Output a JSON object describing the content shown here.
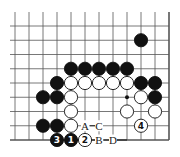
{
  "diagram": {
    "type": "go-board-fragment",
    "columns": 12,
    "rows": 9,
    "edges": {
      "right": true,
      "bottom": true,
      "left": false,
      "top": false
    },
    "colors": {
      "black": "#111111",
      "white": "#ffffff",
      "line": "#555555"
    },
    "star_points": [
      {
        "col": 8,
        "row": 5
      }
    ],
    "stones": [
      {
        "col": 9,
        "row": 1,
        "color": "black"
      },
      {
        "col": 4,
        "row": 3,
        "color": "black"
      },
      {
        "col": 5,
        "row": 3,
        "color": "black"
      },
      {
        "col": 6,
        "row": 3,
        "color": "black"
      },
      {
        "col": 7,
        "row": 3,
        "color": "black"
      },
      {
        "col": 8,
        "row": 3,
        "color": "black"
      },
      {
        "col": 3,
        "row": 4,
        "color": "black"
      },
      {
        "col": 4,
        "row": 4,
        "color": "white"
      },
      {
        "col": 5,
        "row": 4,
        "color": "white"
      },
      {
        "col": 6,
        "row": 4,
        "color": "white"
      },
      {
        "col": 7,
        "row": 4,
        "color": "white"
      },
      {
        "col": 8,
        "row": 4,
        "color": "white"
      },
      {
        "col": 9,
        "row": 4,
        "color": "black"
      },
      {
        "col": 10,
        "row": 4,
        "color": "black"
      },
      {
        "col": 2,
        "row": 5,
        "color": "black"
      },
      {
        "col": 3,
        "row": 5,
        "color": "black"
      },
      {
        "col": 4,
        "row": 5,
        "color": "white"
      },
      {
        "col": 9,
        "row": 5,
        "color": "white"
      },
      {
        "col": 10,
        "row": 5,
        "color": "black"
      },
      {
        "col": 4,
        "row": 6,
        "color": "white"
      },
      {
        "col": 8,
        "row": 6,
        "color": "white"
      },
      {
        "col": 10,
        "row": 6,
        "color": "white"
      },
      {
        "col": 2,
        "row": 7,
        "color": "black"
      },
      {
        "col": 3,
        "row": 7,
        "color": "black"
      },
      {
        "col": 4,
        "row": 7,
        "color": "white"
      },
      {
        "col": 9,
        "row": 7,
        "color": "white",
        "label": "4"
      },
      {
        "col": 3,
        "row": 8,
        "color": "black",
        "label": "3"
      },
      {
        "col": 4,
        "row": 8,
        "color": "black",
        "label": "1"
      },
      {
        "col": 5,
        "row": 8,
        "color": "white",
        "label": "2"
      }
    ],
    "point_labels": [
      {
        "col": 5,
        "row": 7,
        "text": "A"
      },
      {
        "col": 6,
        "row": 7,
        "text": "C"
      },
      {
        "col": 6,
        "row": 8,
        "text": "B"
      },
      {
        "col": 7,
        "row": 8,
        "text": "D"
      }
    ]
  }
}
